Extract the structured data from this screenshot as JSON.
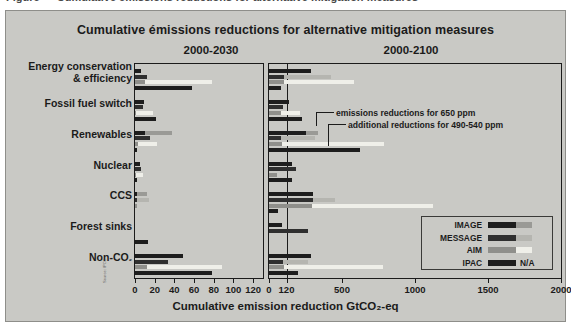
{
  "figure": {
    "cropped_caption": "Figure — Cumulative emissions reductions for alternative mitigation measures",
    "title": "Cumulative émissions reductions for alternative mitigation measures",
    "axis_title": "Cumulative emission reduction GtCO₂-eq",
    "credit": "Source: IPCC",
    "bg_color": "#c9c9c5",
    "frame_color": "#1b1b1b"
  },
  "panels": {
    "left": {
      "label": "2000-2030"
    },
    "right": {
      "label": "2000-2100"
    }
  },
  "annotations": [
    {
      "text": "emissions reductions for 650 ppm"
    },
    {
      "text": "additional reductions for 490-540 ppm"
    }
  ],
  "legend": {
    "na_label": "N/A",
    "items": [
      {
        "name": "IMAGE",
        "color": "#1d1d1d",
        "ext_color": "#9a9a96"
      },
      {
        "name": "MESSAGE",
        "color": "#2f2f2f",
        "ext_color": "#b5b5b0"
      },
      {
        "name": "AIM",
        "color": "#8f8f8b",
        "ext_color": "#efefe9"
      },
      {
        "name": "IPAC",
        "color": "#1d1d1d",
        "ext_color": "#c9c9c5"
      }
    ]
  },
  "chart_data": {
    "type": "bar",
    "orientation": "horizontal",
    "title": "Cumulative émissions reductions for alternative mitigation measures",
    "xlabel": "Cumulative emission reduction GtCO₂-eq",
    "ylabel": "",
    "grid": false,
    "legend_position": "bottom-right",
    "series": [
      "IMAGE",
      "MESSAGE",
      "AIM",
      "IPAC"
    ],
    "series_note": "each bar = reductions for 650 ppm (dark) + additional reductions for 490-540 ppm (light extension)",
    "categories": [
      "Energy conservation & efficiency",
      "Fossil fuel switch",
      "Renewables",
      "Nuclear",
      "CCS",
      "Forest sinks",
      "Non-CO₂"
    ],
    "panels": [
      {
        "name": "2000-2030",
        "xlim": [
          0,
          130
        ],
        "xticks": [
          0,
          20,
          40,
          60,
          80,
          100,
          120
        ],
        "xticklabels": [
          "0",
          "20",
          "40",
          "60",
          "80",
          "100",
          "120"
        ],
        "data": [
          {
            "category": "Energy conservation & efficiency",
            "bars": [
              {
                "model": "IMAGE",
                "base": 6,
                "extra": 0
              },
              {
                "model": "MESSAGE",
                "base": 12,
                "extra": 0
              },
              {
                "model": "AIM",
                "base": 10,
                "extra": 68
              },
              {
                "model": "IPAC",
                "base": 58,
                "extra": 0
              }
            ]
          },
          {
            "category": "Fossil fuel switch",
            "bars": [
              {
                "model": "IMAGE",
                "base": 9,
                "extra": 0
              },
              {
                "model": "MESSAGE",
                "base": 8,
                "extra": 0
              },
              {
                "model": "AIM",
                "base": 1,
                "extra": 17
              },
              {
                "model": "IPAC",
                "base": 21,
                "extra": 0
              }
            ]
          },
          {
            "category": "Renewables",
            "bars": [
              {
                "model": "IMAGE",
                "base": 10,
                "extra": 28
              },
              {
                "model": "MESSAGE",
                "base": 15,
                "extra": 0
              },
              {
                "model": "AIM",
                "base": 3,
                "extra": 19
              },
              {
                "model": "IPAC",
                "base": 2,
                "extra": 0
              }
            ]
          },
          {
            "category": "Nuclear",
            "bars": [
              {
                "model": "IMAGE",
                "base": 5,
                "extra": 0
              },
              {
                "model": "MESSAGE",
                "base": 6,
                "extra": 0
              },
              {
                "model": "AIM",
                "base": 1,
                "extra": 7
              },
              {
                "model": "IPAC",
                "base": 2,
                "extra": 0
              }
            ]
          },
          {
            "category": "CCS",
            "bars": [
              {
                "model": "IMAGE",
                "base": 2,
                "extra": 10
              },
              {
                "model": "MESSAGE",
                "base": 2,
                "extra": 12
              },
              {
                "model": "AIM",
                "base": 1,
                "extra": 0
              },
              {
                "model": "IPAC",
                "base": 0,
                "extra": 0
              }
            ]
          },
          {
            "category": "Forest sinks",
            "bars": [
              {
                "model": "IMAGE",
                "base": 0,
                "extra": 0
              },
              {
                "model": "MESSAGE",
                "base": 0,
                "extra": 0
              },
              {
                "model": "AIM",
                "base": 0,
                "extra": 0
              },
              {
                "model": "IPAC",
                "base": 13,
                "extra": 0
              }
            ]
          },
          {
            "category": "Non-CO₂",
            "bars": [
              {
                "model": "IMAGE",
                "base": 49,
                "extra": 0
              },
              {
                "model": "MESSAGE",
                "base": 34,
                "extra": 0
              },
              {
                "model": "AIM",
                "base": 12,
                "extra": 76
              },
              {
                "model": "IPAC",
                "base": 78,
                "extra": 0
              }
            ]
          }
        ]
      },
      {
        "name": "2000-2100",
        "xlim": [
          0,
          2000
        ],
        "xticks": [
          0,
          120,
          500,
          1000,
          1500,
          2000
        ],
        "xticklabels": [
          "0",
          "120",
          "500",
          "1000",
          "1500",
          "2000"
        ],
        "reference_line": 120,
        "data": [
          {
            "category": "Energy conservation & efficiency",
            "bars": [
              {
                "model": "IMAGE",
                "base": 290,
                "extra": 0
              },
              {
                "model": "MESSAGE",
                "base": 105,
                "extra": 320
              },
              {
                "model": "AIM",
                "base": 100,
                "extra": 480
              },
              {
                "model": "IPAC",
                "base": 80,
                "extra": 0
              }
            ]
          },
          {
            "category": "Fossil fuel switch",
            "bars": [
              {
                "model": "IMAGE",
                "base": 140,
                "extra": 0
              },
              {
                "model": "MESSAGE",
                "base": 95,
                "extra": 0
              },
              {
                "model": "AIM",
                "base": 80,
                "extra": 130
              },
              {
                "model": "IPAC",
                "base": 225,
                "extra": 0
              }
            ]
          },
          {
            "category": "Renewables",
            "bars": [
              {
                "model": "IMAGE",
                "base": 250,
                "extra": 85
              },
              {
                "model": "MESSAGE",
                "base": 85,
                "extra": 230
              },
              {
                "model": "AIM",
                "base": 90,
                "extra": 700
              },
              {
                "model": "IPAC",
                "base": 620,
                "extra": 0
              }
            ]
          },
          {
            "category": "Nuclear",
            "bars": [
              {
                "model": "IMAGE",
                "base": 160,
                "extra": 0
              },
              {
                "model": "MESSAGE",
                "base": 185,
                "extra": 0
              },
              {
                "model": "AIM",
                "base": 55,
                "extra": 0
              },
              {
                "model": "IPAC",
                "base": 160,
                "extra": 0
              }
            ]
          },
          {
            "category": "CCS",
            "bars": [
              {
                "model": "IMAGE",
                "base": 300,
                "extra": 0
              },
              {
                "model": "MESSAGE",
                "base": 300,
                "extra": 155
              },
              {
                "model": "AIM",
                "base": 295,
                "extra": 830
              },
              {
                "model": "IPAC",
                "base": 60,
                "extra": 0
              }
            ]
          },
          {
            "category": "Forest sinks",
            "bars": [
              {
                "model": "IMAGE",
                "base": 90,
                "extra": 0
              },
              {
                "model": "MESSAGE",
                "base": 270,
                "extra": 0
              },
              {
                "model": "AIM",
                "base": 0,
                "extra": 0
              },
              {
                "model": "IPAC",
                "base": 0,
                "extra": 0
              }
            ]
          },
          {
            "category": "Non-CO₂",
            "bars": [
              {
                "model": "IMAGE",
                "base": 290,
                "extra": 0
              },
              {
                "model": "MESSAGE",
                "base": 95,
                "extra": 175
              },
              {
                "model": "AIM",
                "base": 100,
                "extra": 680
              },
              {
                "model": "IPAC",
                "base": 200,
                "extra": 0
              }
            ]
          }
        ]
      }
    ]
  }
}
